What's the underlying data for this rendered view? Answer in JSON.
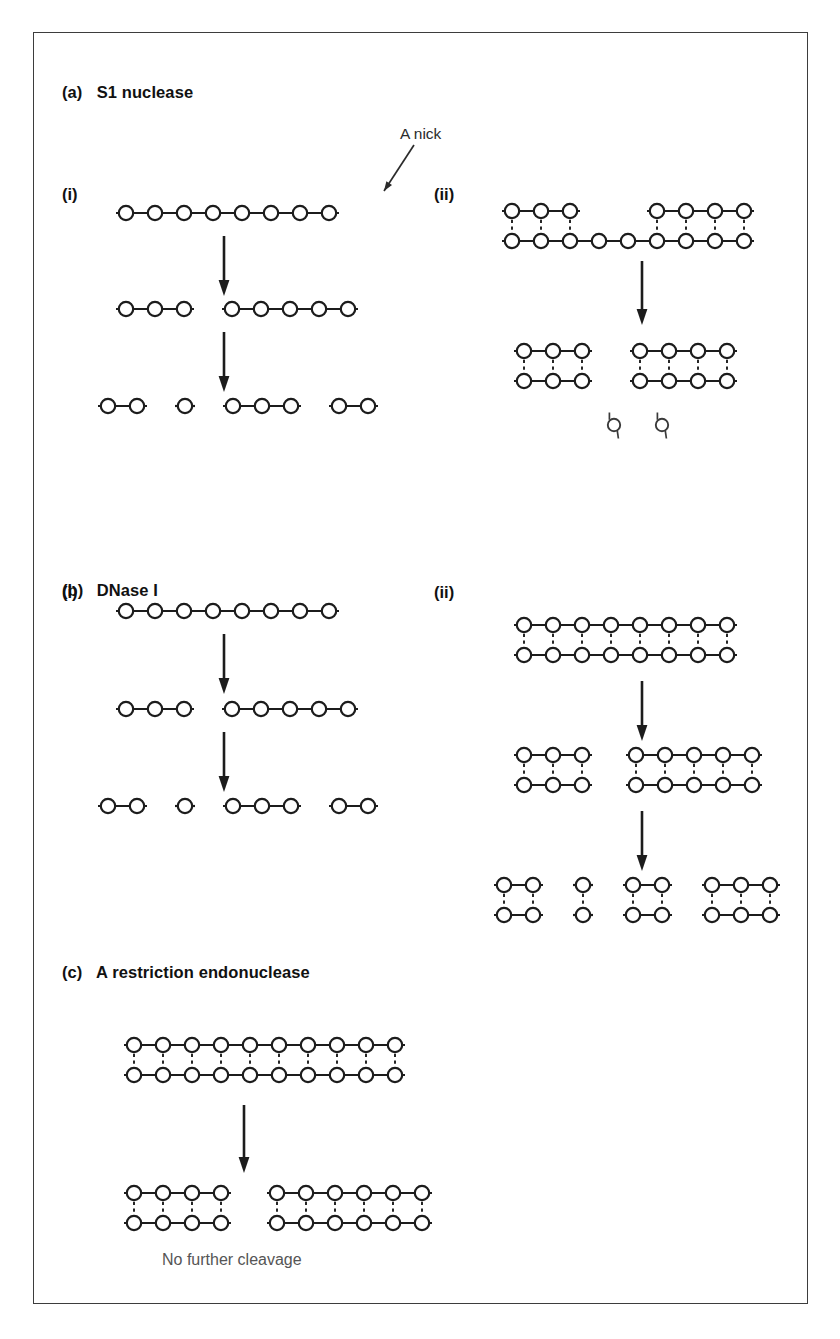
{
  "figure": {
    "sections": [
      {
        "tag": "(a)",
        "title": "S1 nuclease"
      },
      {
        "tag": "(b)",
        "title": "DNase I"
      },
      {
        "tag": "(c)",
        "title": "A restriction endonuclease"
      }
    ],
    "panel_labels": {
      "single_stranded": "(i)",
      "double_stranded": "(ii)"
    },
    "annotations": {
      "nick": "A nick",
      "no_further_cleavage": "No further cleavage"
    },
    "colors": {
      "stroke": "#1c1c1c",
      "frame": "#3d3d3d",
      "caption": "#555555",
      "background": "#ffffff"
    },
    "legend": {
      "circle_meaning": "nucleotide",
      "line_meaning": "phosphodiester backbone",
      "dashed_meaning": "hydrogen-bonded base pair"
    }
  },
  "diagrams": {
    "a_i": {
      "name": "S1 nuclease on single-stranded DNA",
      "rows": [
        {
          "kind": "single",
          "segments": [
            {
              "n": 8
            }
          ]
        },
        {
          "kind": "single",
          "segments": [
            {
              "n": 3
            },
            {
              "n": 5
            }
          ]
        },
        {
          "kind": "single",
          "segments": [
            {
              "n": 2
            },
            {
              "n": 1
            },
            {
              "n": 3
            },
            {
              "n": 2
            }
          ]
        }
      ],
      "arrows": 2
    },
    "a_ii": {
      "name": "S1 nuclease on nicked double-stranded DNA",
      "rows": [
        {
          "kind": "nicked-duplex",
          "top_segments": [
            {
              "n": 3,
              "start": 0
            },
            {
              "n": 4,
              "start": 5
            }
          ],
          "bottom_segments": [
            {
              "n": 9,
              "start": 0
            }
          ],
          "pairs": [
            0,
            1,
            2,
            5,
            6,
            7,
            8
          ]
        },
        {
          "kind": "duplex",
          "segments": [
            {
              "n": 3
            },
            {
              "n": 4
            }
          ],
          "free_nucleotides": 2
        }
      ],
      "arrows": 1
    },
    "b_i": {
      "name": "DNase I on single-stranded DNA",
      "rows": [
        {
          "kind": "single",
          "segments": [
            {
              "n": 8
            }
          ]
        },
        {
          "kind": "single",
          "segments": [
            {
              "n": 3
            },
            {
              "n": 5
            }
          ]
        },
        {
          "kind": "single",
          "segments": [
            {
              "n": 2
            },
            {
              "n": 1
            },
            {
              "n": 3
            },
            {
              "n": 2
            }
          ]
        }
      ],
      "arrows": 2
    },
    "b_ii": {
      "name": "DNase I on double-stranded DNA",
      "rows": [
        {
          "kind": "duplex",
          "segments": [
            {
              "n": 8
            }
          ]
        },
        {
          "kind": "duplex",
          "segments": [
            {
              "n": 3
            },
            {
              "n": 5
            }
          ]
        },
        {
          "kind": "duplex",
          "segments": [
            {
              "n": 2
            },
            {
              "n": 1
            },
            {
              "n": 2
            },
            {
              "n": 3
            }
          ]
        }
      ],
      "arrows": 2
    },
    "c": {
      "name": "Restriction endonuclease on double-stranded DNA",
      "rows": [
        {
          "kind": "duplex",
          "segments": [
            {
              "n": 10
            }
          ]
        },
        {
          "kind": "duplex",
          "segments": [
            {
              "n": 4
            },
            {
              "n": 6
            }
          ]
        }
      ],
      "arrows": 1
    }
  },
  "layout": {
    "headings": [
      {
        "key": "a",
        "x": 28,
        "y": 52
      },
      {
        "key": "b",
        "x": 28,
        "y": 548
      },
      {
        "key": "c",
        "x": 28,
        "y": 930
      }
    ],
    "panel_tags": [
      {
        "text": "(i)",
        "x": 28,
        "y": 152
      },
      {
        "text": "(ii)",
        "x": 400,
        "y": 152
      },
      {
        "text": "(i)",
        "x": 28,
        "y": 550
      },
      {
        "text": "(ii)",
        "x": 400,
        "y": 550
      }
    ],
    "nick_label": {
      "x": 366,
      "y": 96
    },
    "caption": {
      "x": 125,
      "y": 1222
    }
  }
}
